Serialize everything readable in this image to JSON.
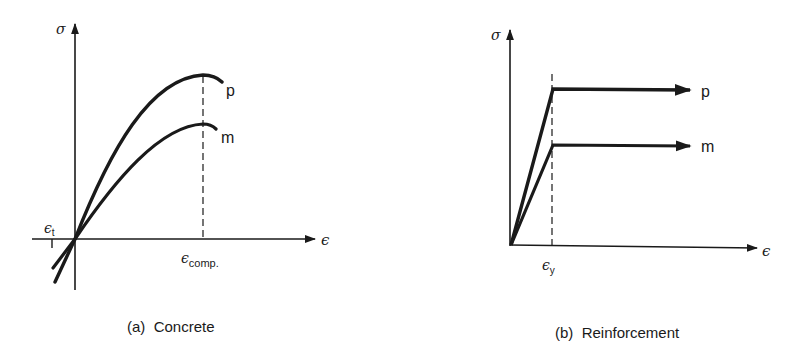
{
  "panels": [
    {
      "id": "a",
      "caption": "(a)  Concrete",
      "y_axis_label": "σ",
      "x_axis_label": "ϵ",
      "curves": [
        {
          "name": "p",
          "label": "p",
          "shape": "parabolic rise to peak at ϵ_comp then slight descent"
        },
        {
          "name": "m",
          "label": "m",
          "shape": "parabolic rise to lower peak at ϵ_comp then slight descent"
        }
      ],
      "markers": {
        "tension_strain": {
          "symbol": "ϵ",
          "subscript": "t"
        },
        "compression_strain": {
          "symbol": "ϵ",
          "subscript": "comp."
        }
      }
    },
    {
      "id": "b",
      "caption": "(b)  Reinforcement",
      "y_axis_label": "σ",
      "x_axis_label": "ϵ",
      "curves": [
        {
          "name": "p",
          "label": "p",
          "shape": "linear elastic to ϵ_y then horizontal plastic plateau (arrow)"
        },
        {
          "name": "m",
          "label": "m",
          "shape": "linear elastic to ϵ_y then lower horizontal plastic plateau (arrow)"
        }
      ],
      "markers": {
        "yield_strain": {
          "symbol": "ϵ",
          "subscript": "y"
        }
      }
    }
  ],
  "colors": {
    "ink": "#1a1a1a",
    "background": "#ffffff"
  }
}
